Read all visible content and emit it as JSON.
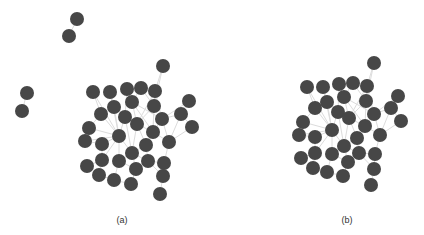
{
  "style": {
    "node_color": "#474747",
    "edge_color": "#dcdcdc",
    "node_radius": 7,
    "background": "#ffffff"
  },
  "panels": [
    {
      "id": "a",
      "caption": "(a)",
      "caption_pos": [
        122,
        215
      ],
      "nodes": [
        [
          77,
          19
        ],
        [
          69,
          36
        ],
        [
          27,
          93
        ],
        [
          22,
          111
        ],
        [
          163,
          66
        ],
        [
          93,
          92
        ],
        [
          110,
          92
        ],
        [
          127,
          89
        ],
        [
          141,
          88
        ],
        [
          155,
          91
        ],
        [
          189,
          101
        ],
        [
          114,
          107
        ],
        [
          132,
          102
        ],
        [
          154,
          106
        ],
        [
          101,
          114
        ],
        [
          125,
          117
        ],
        [
          137,
          124
        ],
        [
          162,
          119
        ],
        [
          181,
          114
        ],
        [
          192,
          127
        ],
        [
          89,
          128
        ],
        [
          119,
          136
        ],
        [
          153,
          132
        ],
        [
          85,
          141
        ],
        [
          102,
          144
        ],
        [
          146,
          145
        ],
        [
          169,
          142
        ],
        [
          132,
          153
        ],
        [
          87,
          166
        ],
        [
          102,
          160
        ],
        [
          119,
          161
        ],
        [
          148,
          161
        ],
        [
          164,
          163
        ],
        [
          136,
          169
        ],
        [
          99,
          175
        ],
        [
          114,
          180
        ],
        [
          131,
          184
        ],
        [
          163,
          176
        ],
        [
          160,
          194
        ]
      ],
      "edges": [
        [
          0,
          1
        ],
        [
          2,
          3
        ],
        [
          4,
          9
        ],
        [
          4,
          13
        ],
        [
          5,
          14
        ],
        [
          5,
          21
        ],
        [
          6,
          11
        ],
        [
          6,
          21
        ],
        [
          7,
          12
        ],
        [
          7,
          15
        ],
        [
          8,
          12
        ],
        [
          8,
          13
        ],
        [
          9,
          13
        ],
        [
          9,
          17
        ],
        [
          10,
          18
        ],
        [
          10,
          17
        ],
        [
          11,
          15
        ],
        [
          11,
          21
        ],
        [
          12,
          16
        ],
        [
          12,
          17
        ],
        [
          13,
          16
        ],
        [
          13,
          22
        ],
        [
          14,
          21
        ],
        [
          14,
          20
        ],
        [
          15,
          16
        ],
        [
          15,
          21
        ],
        [
          16,
          22
        ],
        [
          16,
          25
        ],
        [
          16,
          27
        ],
        [
          17,
          18
        ],
        [
          17,
          22
        ],
        [
          18,
          19
        ],
        [
          18,
          26
        ],
        [
          19,
          26
        ],
        [
          20,
          21
        ],
        [
          21,
          23
        ],
        [
          21,
          24
        ],
        [
          21,
          27
        ],
        [
          21,
          29
        ],
        [
          21,
          30
        ],
        [
          22,
          25
        ],
        [
          22,
          26
        ],
        [
          22,
          13
        ],
        [
          23,
          24
        ],
        [
          24,
          29
        ],
        [
          25,
          27
        ],
        [
          25,
          31
        ],
        [
          26,
          32
        ],
        [
          27,
          30
        ],
        [
          27,
          31
        ],
        [
          27,
          33
        ],
        [
          28,
          29
        ],
        [
          29,
          34
        ],
        [
          30,
          33
        ],
        [
          30,
          35
        ],
        [
          31,
          32
        ],
        [
          31,
          37
        ],
        [
          33,
          36
        ],
        [
          32,
          37
        ],
        [
          37,
          38
        ],
        [
          34,
          35
        ],
        [
          35,
          36
        ],
        [
          15,
          27
        ],
        [
          11,
          16
        ],
        [
          17,
          26
        ],
        [
          12,
          22
        ],
        [
          9,
          16
        ]
      ]
    },
    {
      "id": "b",
      "caption": "(b)",
      "caption_pos": [
        347,
        215
      ],
      "nodes": [
        [
          374,
          63
        ],
        [
          307,
          87
        ],
        [
          323,
          87
        ],
        [
          339,
          84
        ],
        [
          353,
          83
        ],
        [
          367,
          86
        ],
        [
          398,
          96
        ],
        [
          327,
          102
        ],
        [
          344,
          97
        ],
        [
          366,
          101
        ],
        [
          315,
          108
        ],
        [
          338,
          112
        ],
        [
          349,
          118
        ],
        [
          374,
          114
        ],
        [
          391,
          108
        ],
        [
          401,
          121
        ],
        [
          303,
          122
        ],
        [
          332,
          130
        ],
        [
          365,
          126
        ],
        [
          299,
          135
        ],
        [
          315,
          137
        ],
        [
          357,
          138
        ],
        [
          380,
          135
        ],
        [
          344,
          146
        ],
        [
          301,
          158
        ],
        [
          315,
          153
        ],
        [
          332,
          154
        ],
        [
          359,
          153
        ],
        [
          375,
          154
        ],
        [
          348,
          162
        ],
        [
          313,
          168
        ],
        [
          327,
          172
        ],
        [
          343,
          176
        ],
        [
          374,
          169
        ],
        [
          371,
          185
        ]
      ],
      "edges": [
        [
          0,
          5
        ],
        [
          0,
          9
        ],
        [
          1,
          10
        ],
        [
          1,
          17
        ],
        [
          2,
          7
        ],
        [
          2,
          17
        ],
        [
          3,
          8
        ],
        [
          3,
          11
        ],
        [
          4,
          8
        ],
        [
          4,
          9
        ],
        [
          5,
          9
        ],
        [
          5,
          13
        ],
        [
          6,
          14
        ],
        [
          6,
          13
        ],
        [
          7,
          11
        ],
        [
          7,
          17
        ],
        [
          8,
          12
        ],
        [
          8,
          13
        ],
        [
          9,
          12
        ],
        [
          9,
          18
        ],
        [
          10,
          17
        ],
        [
          10,
          16
        ],
        [
          11,
          12
        ],
        [
          11,
          17
        ],
        [
          12,
          18
        ],
        [
          12,
          21
        ],
        [
          12,
          23
        ],
        [
          13,
          14
        ],
        [
          13,
          18
        ],
        [
          14,
          15
        ],
        [
          14,
          22
        ],
        [
          15,
          22
        ],
        [
          16,
          17
        ],
        [
          17,
          19
        ],
        [
          17,
          20
        ],
        [
          17,
          23
        ],
        [
          17,
          25
        ],
        [
          17,
          26
        ],
        [
          18,
          21
        ],
        [
          18,
          22
        ],
        [
          19,
          20
        ],
        [
          20,
          25
        ],
        [
          21,
          23
        ],
        [
          21,
          27
        ],
        [
          22,
          28
        ],
        [
          23,
          26
        ],
        [
          23,
          27
        ],
        [
          23,
          29
        ],
        [
          24,
          25
        ],
        [
          25,
          30
        ],
        [
          26,
          29
        ],
        [
          26,
          31
        ],
        [
          27,
          28
        ],
        [
          27,
          33
        ],
        [
          29,
          32
        ],
        [
          28,
          33
        ],
        [
          33,
          34
        ],
        [
          30,
          31
        ],
        [
          31,
          32
        ],
        [
          11,
          23
        ],
        [
          7,
          12
        ],
        [
          13,
          22
        ],
        [
          8,
          18
        ],
        [
          5,
          12
        ]
      ]
    }
  ]
}
